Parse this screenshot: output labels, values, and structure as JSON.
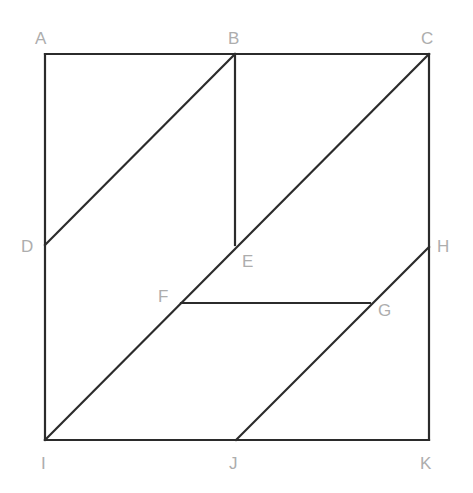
{
  "figure": {
    "type": "geometry-diagram",
    "canvas": {
      "width": 473,
      "height": 493
    },
    "style": {
      "background_color": "#ffffff",
      "stroke_color": "#2b2b2b",
      "stroke_width": 2.2,
      "label_color": "#adadad",
      "label_font_size": 17
    },
    "square": {
      "name": "ACKI",
      "corners": [
        "A",
        "C",
        "K",
        "I"
      ],
      "left": 45,
      "top": 54,
      "right": 429,
      "bottom": 440,
      "width": 384,
      "height": 386
    },
    "points": [
      {
        "id": "A",
        "x": 45,
        "y": 54,
        "label": "A",
        "label_x": 35,
        "label_y": 30,
        "on": "top-left-corner"
      },
      {
        "id": "B",
        "x": 235,
        "y": 54,
        "label": "B",
        "label_x": 228,
        "label_y": 30,
        "on": "top-edge"
      },
      {
        "id": "C",
        "x": 429,
        "y": 54,
        "label": "C",
        "label_x": 421,
        "label_y": 30,
        "on": "top-right-corner"
      },
      {
        "id": "D",
        "x": 45,
        "y": 245,
        "label": "D",
        "label_x": 21,
        "label_y": 238,
        "on": "left-edge"
      },
      {
        "id": "E",
        "x": 235,
        "y": 245,
        "label": "E",
        "label_x": 242,
        "label_y": 253,
        "on": "diagonal-IC"
      },
      {
        "id": "F",
        "x": 181,
        "y": 303,
        "label": "F",
        "label_x": 158,
        "label_y": 288,
        "on": "diagonal-IC"
      },
      {
        "id": "G",
        "x": 370,
        "y": 303,
        "label": "G",
        "label_x": 378,
        "label_y": 302,
        "on": "diagonal-JH"
      },
      {
        "id": "H",
        "x": 429,
        "y": 247,
        "label": "H",
        "label_x": 437,
        "label_y": 238,
        "on": "right-edge"
      },
      {
        "id": "I",
        "x": 45,
        "y": 440,
        "label": "I",
        "label_x": 41,
        "label_y": 455,
        "on": "bottom-left-corner"
      },
      {
        "id": "J",
        "x": 236,
        "y": 440,
        "label": "J",
        "label_x": 229,
        "label_y": 455,
        "on": "bottom-edge"
      },
      {
        "id": "K",
        "x": 429,
        "y": 440,
        "label": "K",
        "label_x": 420,
        "label_y": 455,
        "on": "bottom-right-corner"
      }
    ],
    "segments": [
      {
        "id": "AC",
        "from": "A",
        "to": "C",
        "kind": "square-top-edge",
        "x1": 45,
        "y1": 54,
        "x2": 429,
        "y2": 54
      },
      {
        "id": "CK",
        "from": "C",
        "to": "K",
        "kind": "square-right-edge",
        "x1": 429,
        "y1": 54,
        "x2": 429,
        "y2": 440
      },
      {
        "id": "KI",
        "from": "K",
        "to": "I",
        "kind": "square-bottom-edge",
        "x1": 429,
        "y1": 440,
        "x2": 45,
        "y2": 440
      },
      {
        "id": "IA",
        "from": "I",
        "to": "A",
        "kind": "square-left-edge",
        "x1": 45,
        "y1": 440,
        "x2": 45,
        "y2": 54
      },
      {
        "id": "DB",
        "from": "D",
        "to": "B",
        "kind": "diagonal",
        "x1": 45,
        "y1": 245,
        "x2": 235,
        "y2": 54
      },
      {
        "id": "BE",
        "from": "B",
        "to": "E",
        "kind": "vertical",
        "x1": 235,
        "y1": 54,
        "x2": 235,
        "y2": 245
      },
      {
        "id": "IC",
        "from": "I",
        "to": "C",
        "kind": "diagonal",
        "x1": 45,
        "y1": 440,
        "x2": 429,
        "y2": 54
      },
      {
        "id": "FG",
        "from": "F",
        "to": "G",
        "kind": "horizontal",
        "x1": 181,
        "y1": 303,
        "x2": 370,
        "y2": 303
      },
      {
        "id": "JH",
        "from": "J",
        "to": "H",
        "kind": "diagonal",
        "x1": 236,
        "y1": 440,
        "x2": 429,
        "y2": 247
      }
    ]
  }
}
